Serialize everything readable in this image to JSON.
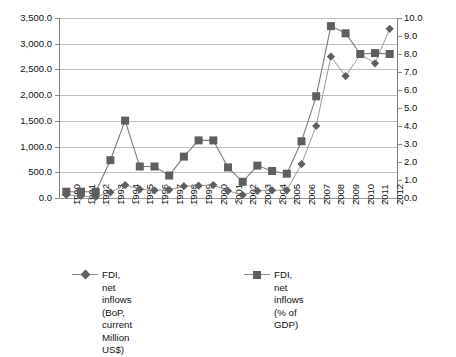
{
  "chart_data": {
    "type": "line",
    "title": "",
    "subtitle": "",
    "xlabel": "",
    "ylabel": "",
    "y2label": "",
    "grid": true,
    "legend_position": "bottom",
    "categories": [
      "1990",
      "1991",
      "1992",
      "1993",
      "1994",
      "1995",
      "1996",
      "1997",
      "1998",
      "1999",
      "2000",
      "2001",
      "2002",
      "2003",
      "2004",
      "2005",
      "2006",
      "2007",
      "2008",
      "2009",
      "2010",
      "2011",
      "2012"
    ],
    "y_left": {
      "min": 0.0,
      "max": 3500.0,
      "step": 500.0,
      "ticks": [
        "0.0",
        "500.0",
        "1,000.0",
        "1,500.0",
        "2,000.0",
        "2,500.0",
        "3,000.0",
        "3,500.0"
      ],
      "tick_values": [
        0,
        500,
        1000,
        1500,
        2000,
        2500,
        3000,
        3500
      ]
    },
    "y_right": {
      "min": 0.0,
      "max": 10.0,
      "step": 1.0,
      "ticks": [
        "0.0",
        "1.0",
        "2.0",
        "3.0",
        "4.0",
        "5.0",
        "6.0",
        "7.0",
        "8.0",
        "9.0",
        "10.0"
      ],
      "tick_values": [
        0,
        1,
        2,
        3,
        4,
        5,
        6,
        7,
        8,
        9,
        10
      ]
    },
    "series": [
      {
        "name": "FDI, net inflows (BoP, current Million US$)",
        "name_line1": "FDI, net inflows",
        "name_line2": "(BoP, current Million US$)",
        "axis": "left",
        "marker": "diamond",
        "color": "#5f5f5f",
        "values": [
          60,
          40,
          20,
          110,
          250,
          170,
          150,
          160,
          230,
          240,
          250,
          140,
          60,
          140,
          150,
          150,
          660,
          1400,
          2750,
          2370,
          2790,
          2620,
          3290
        ]
      },
      {
        "name": "FDI, net inflows (% of GDP)",
        "axis": "right",
        "marker": "square",
        "color": "#5f5f5f",
        "values": [
          0.35,
          0.35,
          0.35,
          2.1,
          4.3,
          1.75,
          1.75,
          1.25,
          2.3,
          3.2,
          3.2,
          1.7,
          0.9,
          1.8,
          1.5,
          1.35,
          3.15,
          5.65,
          9.55,
          9.15,
          8.0,
          8.05,
          8.0
        ]
      }
    ]
  },
  "legend": {
    "entries": [
      {
        "label_line1": "FDI, net inflows",
        "label_line2": "(BoP, current Million US$)",
        "marker": "diamond"
      },
      {
        "label_line1": "FDI, net inflows (% of GDP)",
        "label_line2": "",
        "marker": "square"
      }
    ]
  }
}
